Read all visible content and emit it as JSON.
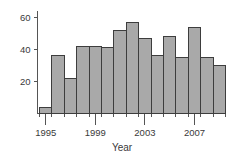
{
  "chart_data": {
    "type": "bar",
    "title": "",
    "subtitle": "",
    "xlabel": "Year",
    "ylabel": "",
    "categories": [
      "1995",
      "1996",
      "1997",
      "1998",
      "1999",
      "2000",
      "2001",
      "2002",
      "2003",
      "2004",
      "2005",
      "2006",
      "2007",
      "2008",
      "2009"
    ],
    "values": [
      4,
      36,
      22,
      42,
      42,
      41,
      52,
      57,
      47,
      36,
      48,
      35,
      54,
      35,
      30
    ],
    "series": [
      {
        "name": "Count",
        "values": [
          4,
          36,
          22,
          42,
          42,
          41,
          52,
          57,
          47,
          36,
          48,
          35,
          54,
          35,
          30
        ]
      }
    ],
    "x_tick_labels": [
      "1995",
      "1999",
      "2003",
      "2007"
    ],
    "x_tick_categories": [
      "1995",
      "1999",
      "2003",
      "2007"
    ],
    "y_tick_labels": [
      "20",
      "40",
      "60"
    ],
    "y_tick_values": [
      20,
      40,
      60
    ],
    "ylim": [
      0,
      64
    ],
    "grid": false,
    "legend": false,
    "legend_position": "none",
    "bar_fill_color": "#a9a9a9",
    "bar_edge_color": "#3d3d3d",
    "axis_color": "#555555",
    "text_color": "#3a3a3a",
    "background_color": "#ffffff"
  },
  "axis": {
    "x_title": "Year",
    "y_title": ""
  },
  "ticks": {
    "y": [
      {
        "label": "60",
        "value": 60
      },
      {
        "label": "40",
        "value": 40
      },
      {
        "label": "20",
        "value": 20
      }
    ],
    "x": [
      {
        "label": "1995",
        "index": 0
      },
      {
        "label": "1999",
        "index": 4
      },
      {
        "label": "2003",
        "index": 8
      },
      {
        "label": "2007",
        "index": 12
      }
    ]
  }
}
